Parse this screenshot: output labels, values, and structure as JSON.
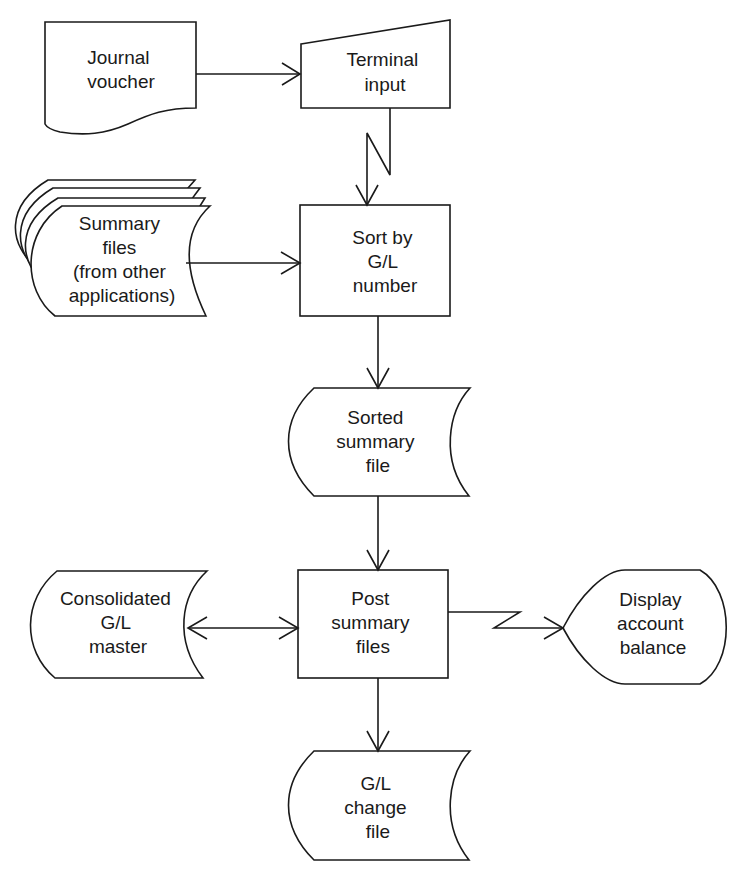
{
  "diagram": {
    "type": "system-flowchart",
    "colors": {
      "stroke": "#1a1a1a",
      "background": "#ffffff"
    },
    "nodes": [
      {
        "id": "journal-voucher",
        "shape": "document",
        "lines": [
          "Journal",
          "voucher"
        ]
      },
      {
        "id": "terminal-input",
        "shape": "manual-input",
        "lines": [
          "Terminal",
          "input"
        ]
      },
      {
        "id": "summary-files",
        "shape": "multiple-stored-data",
        "lines": [
          "Summary",
          "files",
          "(from other",
          "applications)"
        ]
      },
      {
        "id": "sort-by-gl",
        "shape": "process",
        "lines": [
          "Sort by",
          "G/L",
          "number"
        ]
      },
      {
        "id": "sorted-summary-file",
        "shape": "stored-data",
        "lines": [
          "Sorted",
          "summary",
          "file"
        ]
      },
      {
        "id": "consolidated-gl-master",
        "shape": "stored-data",
        "lines": [
          "Consolidated",
          "G/L",
          "master"
        ]
      },
      {
        "id": "post-summary-files",
        "shape": "process",
        "lines": [
          "Post",
          "summary",
          "files"
        ]
      },
      {
        "id": "display-account-balance",
        "shape": "display",
        "lines": [
          "Display",
          "account",
          "balance"
        ]
      },
      {
        "id": "gl-change-file",
        "shape": "stored-data",
        "lines": [
          "G/L",
          "change",
          "file"
        ]
      }
    ],
    "edges": [
      {
        "from": "journal-voucher",
        "to": "terminal-input",
        "style": "arrow"
      },
      {
        "from": "terminal-input",
        "to": "sort-by-gl",
        "style": "communication-link"
      },
      {
        "from": "summary-files",
        "to": "sort-by-gl",
        "style": "arrow"
      },
      {
        "from": "sort-by-gl",
        "to": "sorted-summary-file",
        "style": "arrow"
      },
      {
        "from": "sorted-summary-file",
        "to": "post-summary-files",
        "style": "arrow"
      },
      {
        "from": "post-summary-files",
        "to": "consolidated-gl-master",
        "style": "bidirectional-arrow"
      },
      {
        "from": "post-summary-files",
        "to": "display-account-balance",
        "style": "communication-link"
      },
      {
        "from": "post-summary-files",
        "to": "gl-change-file",
        "style": "arrow"
      }
    ]
  }
}
